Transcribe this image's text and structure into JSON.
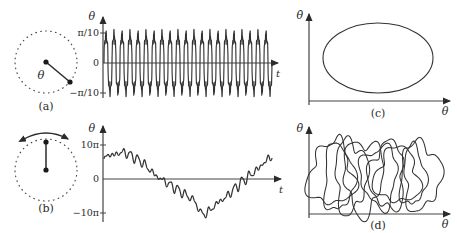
{
  "figure": {
    "caption_labels": {
      "a": "(a)",
      "b": "(b)",
      "c": "(c)",
      "d": "(d)"
    },
    "colors": {
      "ink": "#2b2b2b",
      "curve": "#333333",
      "axis": "#555555",
      "background": "#ffffff"
    }
  },
  "panel_a": {
    "name": "rotating-pendulum-schematic",
    "angle_label": "θ",
    "panel_label": "(a)",
    "description": "dashed circle with radial rod from pivot to bob"
  },
  "panel_b": {
    "name": "oscillating-pendulum-schematic",
    "panel_label": "(b)",
    "description": "dashed circle with vertical rod and double headed swing arrow"
  },
  "chart_data": [
    {
      "id": "theta-vs-time-periodic",
      "type": "line",
      "title": "",
      "xlabel": "t",
      "ylabel": "θ",
      "yticks": [
        "π/10",
        "0",
        "−π/10"
      ],
      "ytick_values": [
        0.3141593,
        0,
        -0.3141593
      ],
      "ylim": [
        -0.4398,
        0.4398
      ],
      "xlim": [
        0,
        100
      ],
      "grid": false,
      "legend": null,
      "series": [
        {
          "name": "θ(t) periodic",
          "description": "regular small-amplitude oscillation, ~21 cycles, amplitude near π/10 with fine high-frequency ripple",
          "cycles": 21,
          "amplitude": 0.3141593,
          "ripple_amplitude": 0.075,
          "ripple_frequency_ratio": 5
        }
      ]
    },
    {
      "id": "theta-vs-time-chaotic",
      "type": "line",
      "title": "",
      "xlabel": "t",
      "ylabel": "θ",
      "yticks": [
        "10π",
        "0",
        "−10π"
      ],
      "ytick_values": [
        31.4159,
        0,
        -31.4159
      ],
      "ylim": [
        -44,
        44
      ],
      "xlim": [
        0,
        100
      ],
      "grid": false,
      "legend": null,
      "series": [
        {
          "name": "θ(t) chaotic",
          "description": "irregular drifting rotation: starts near +7π, wanders down below −10π near mid-run, then climbs back up past +10π",
          "x": [
            0,
            2,
            4,
            6,
            8,
            10,
            12,
            14,
            16,
            18,
            20,
            22,
            24,
            26,
            28,
            30,
            32,
            34,
            36,
            38,
            40,
            42,
            44,
            46,
            48,
            50,
            52,
            54,
            56,
            58,
            60,
            62,
            64,
            66,
            68,
            70,
            72,
            74,
            76,
            78,
            80,
            82,
            84,
            86,
            88,
            90,
            92,
            94,
            96,
            98,
            100
          ],
          "y": [
            18,
            21,
            24,
            20,
            26,
            22,
            27,
            21,
            24,
            18,
            20,
            14,
            16,
            8,
            10,
            2,
            4,
            -2,
            0,
            -6,
            -4,
            -10,
            -8,
            -14,
            -12,
            -18,
            -16,
            -22,
            -26,
            -31,
            -34,
            -28,
            -30,
            -22,
            -24,
            -17,
            -20,
            -12,
            -14,
            -6,
            -8,
            0,
            -3,
            5,
            2,
            10,
            7,
            16,
            13,
            22,
            18
          ]
        }
      ]
    },
    {
      "id": "phase-portrait-periodic",
      "type": "line",
      "title": "",
      "xlabel": "θ",
      "ylabel": "θ̇",
      "panel_label": "(c)",
      "grid": false,
      "legend": null,
      "series": [
        {
          "name": "limit cycle",
          "description": "single smooth closed ellipse orbit in the θ – θ̇ plane",
          "shape": "ellipse",
          "center": [
            0.5,
            0.5
          ],
          "radii": [
            0.36,
            0.27
          ]
        }
      ]
    },
    {
      "id": "phase-portrait-chaotic",
      "type": "line",
      "title": "",
      "xlabel": "θ",
      "ylabel": "θ̇",
      "panel_label": "(d)",
      "grid": false,
      "legend": null,
      "series": [
        {
          "name": "strange attractor",
          "description": "many overlapping irregular loops filling a band of the θ – θ̇ plane",
          "loop_count": 9
        }
      ]
    }
  ]
}
